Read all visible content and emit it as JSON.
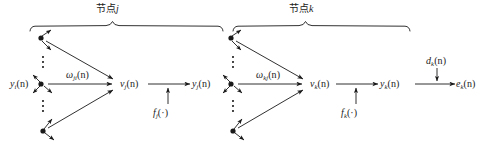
{
  "figure": {
    "type": "neural-network-backpropagation-signal-flow-diagram",
    "background_color": "#ffffff",
    "stroke_color": "#1a1a1a",
    "width": 487,
    "height": 152
  },
  "group_braces": [
    {
      "id": "brace-node-j",
      "label": "节点",
      "label_italic": "j",
      "x_start": 30,
      "x_end": 226,
      "y": 26,
      "label_x": 112,
      "label_y": 8
    },
    {
      "id": "brace-node-k",
      "label": "节点",
      "label_italic": "k",
      "x_start": 232,
      "x_end": 412,
      "y": 26,
      "label_x": 305,
      "label_y": 8
    }
  ],
  "labels": [
    {
      "name": "input-signal-yi",
      "base": "y",
      "sub": "i",
      "tail": "(n)",
      "x": 10,
      "y": 80
    },
    {
      "name": "weight-wji",
      "base": "ω",
      "sub": "ji",
      "tail": "(n)",
      "x": 68,
      "y": 71
    },
    {
      "name": "induced-local-field-vj",
      "base": "v",
      "sub": "j",
      "tail": "(n)",
      "x": 122,
      "y": 80
    },
    {
      "name": "activation-function-fj",
      "base": "f",
      "sub": "j",
      "tail": "(·)",
      "x": 153,
      "y": 110
    },
    {
      "name": "output-signal-yj",
      "base": "y",
      "sub": "j",
      "tail": "(n)",
      "x": 192,
      "y": 80
    },
    {
      "name": "weight-wkj",
      "base": "ω",
      "sub": "kj",
      "tail": "(n)",
      "x": 258,
      "y": 71
    },
    {
      "name": "induced-local-field-vk",
      "base": "v",
      "sub": "k",
      "tail": "(n)",
      "x": 310,
      "y": 80
    },
    {
      "name": "activation-function-fk",
      "base": "f",
      "sub": "k",
      "tail": "(·)",
      "x": 341,
      "y": 110
    },
    {
      "name": "output-signal-yk",
      "base": "y",
      "sub": "k",
      "tail": "(n)",
      "x": 380,
      "y": 80
    },
    {
      "name": "desired-response-dk",
      "base": "d",
      "sub": "k",
      "tail": "(n)",
      "x": 428,
      "y": 62
    },
    {
      "name": "error-signal-ek",
      "base": "e",
      "sub": "k",
      "tail": "(n)",
      "x": 457,
      "y": 80
    }
  ],
  "nodes": [
    {
      "name": "source-node-j-top",
      "x": 41,
      "y": 38
    },
    {
      "name": "source-node-j-middle",
      "x": 41,
      "y": 84
    },
    {
      "name": "source-node-j-bottom",
      "x": 43,
      "y": 131
    },
    {
      "name": "source-node-k-top",
      "x": 231,
      "y": 38
    },
    {
      "name": "source-node-k-middle",
      "x": 231,
      "y": 84
    },
    {
      "name": "source-node-k-bottom",
      "x": 233,
      "y": 131
    }
  ],
  "summing_points": [
    {
      "name": "summing-junction-vj",
      "x": 118,
      "y": 84
    },
    {
      "name": "summing-junction-vk",
      "x": 308,
      "y": 84
    }
  ],
  "ellipses": [
    {
      "name": "vertical-ellipsis-j-upper",
      "x": 43,
      "y_start": 56,
      "y_end": 68
    },
    {
      "name": "vertical-ellipsis-j-lower",
      "x": 43,
      "y_start": 100,
      "y_end": 113
    },
    {
      "name": "vertical-ellipsis-k-upper",
      "x": 233,
      "y_start": 56,
      "y_end": 68
    },
    {
      "name": "vertical-ellipsis-k-lower",
      "x": 233,
      "y_start": 100,
      "y_end": 113
    }
  ]
}
